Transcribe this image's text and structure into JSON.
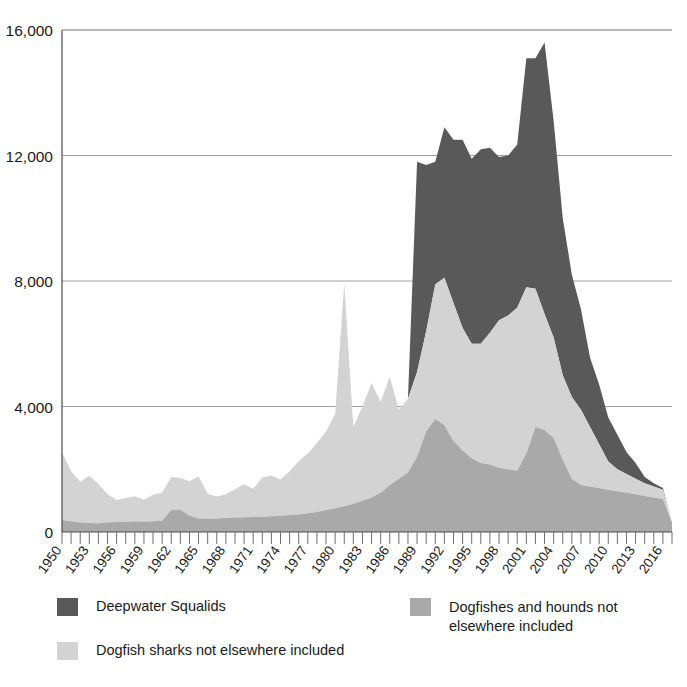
{
  "chart_data": {
    "type": "area",
    "stacked": true,
    "title": "",
    "xlabel": "",
    "ylabel": "",
    "ylim": [
      0,
      16000
    ],
    "xlim": [
      1950,
      2017
    ],
    "grid": true,
    "legend_position": "bottom",
    "ytick_labels": [
      "16,000",
      "12,000",
      "8,000",
      "4,000",
      "0"
    ],
    "ytick_values": [
      16000,
      12000,
      8000,
      4000,
      0
    ],
    "xtick_labels": [
      "1950",
      "1953",
      "1956",
      "1959",
      "1962",
      "1965",
      "1968",
      "1971",
      "1974",
      "1977",
      "1980",
      "1983",
      "1986",
      "1989",
      "1992",
      "1995",
      "1998",
      "2001",
      "2004",
      "2007",
      "2010",
      "2013",
      "2016"
    ],
    "xtick_values": [
      1950,
      1953,
      1956,
      1959,
      1962,
      1965,
      1968,
      1971,
      1974,
      1977,
      1980,
      1983,
      1986,
      1989,
      1992,
      1995,
      1998,
      2001,
      2004,
      2007,
      2010,
      2013,
      2016
    ],
    "x": [
      1950,
      1951,
      1952,
      1953,
      1954,
      1955,
      1956,
      1957,
      1958,
      1959,
      1960,
      1961,
      1962,
      1963,
      1964,
      1965,
      1966,
      1967,
      1968,
      1969,
      1970,
      1971,
      1972,
      1973,
      1974,
      1975,
      1976,
      1977,
      1978,
      1979,
      1980,
      1981,
      1982,
      1983,
      1984,
      1985,
      1986,
      1987,
      1988,
      1989,
      1990,
      1991,
      1992,
      1993,
      1994,
      1995,
      1996,
      1997,
      1998,
      1999,
      2000,
      2001,
      2002,
      2003,
      2004,
      2005,
      2006,
      2007,
      2008,
      2009,
      2010,
      2011,
      2012,
      2013,
      2014,
      2015,
      2016,
      2017
    ],
    "series": [
      {
        "name": "Dogfishes and hounds not elsewhere included",
        "color": "#a9a9a9",
        "stack_order": 1,
        "values": [
          380,
          340,
          300,
          290,
          280,
          300,
          320,
          330,
          340,
          330,
          340,
          360,
          700,
          720,
          520,
          430,
          420,
          430,
          450,
          460,
          470,
          480,
          490,
          500,
          520,
          540,
          560,
          600,
          640,
          700,
          760,
          820,
          900,
          1000,
          1100,
          1250,
          1500,
          1700,
          1900,
          2400,
          3200,
          3600,
          3400,
          2900,
          2600,
          2350,
          2200,
          2150,
          2050,
          2000,
          1950,
          2500,
          3350,
          3250,
          3000,
          2300,
          1700,
          1500,
          1450,
          1400,
          1350,
          1300,
          1250,
          1200,
          1150,
          1100,
          1050,
          300
        ]
      },
      {
        "name": "Dogfish sharks not elsewhere included",
        "color": "#d3d3d3",
        "stack_order": 2,
        "values": [
          2150,
          1600,
          1300,
          1500,
          1250,
          900,
          700,
          750,
          800,
          700,
          850,
          900,
          1050,
          1000,
          1100,
          1350,
          800,
          700,
          750,
          900,
          1050,
          900,
          1250,
          1300,
          1150,
          1400,
          1700,
          1900,
          2200,
          2500,
          3000,
          7100,
          2450,
          3000,
          3650,
          2900,
          3450,
          2200,
          2350,
          2700,
          3200,
          4300,
          4700,
          4400,
          3900,
          3650,
          3800,
          4200,
          4700,
          4900,
          5200,
          5300,
          4400,
          3700,
          3200,
          2700,
          2600,
          2400,
          1900,
          1400,
          900,
          700,
          600,
          500,
          400,
          350,
          300,
          0
        ]
      },
      {
        "name": "Deepwater Squalids",
        "color": "#595959",
        "stack_order": 3,
        "values": [
          0,
          0,
          0,
          0,
          0,
          0,
          0,
          0,
          0,
          0,
          0,
          0,
          0,
          0,
          0,
          0,
          0,
          0,
          0,
          0,
          0,
          0,
          0,
          0,
          0,
          0,
          0,
          0,
          0,
          0,
          0,
          0,
          0,
          0,
          0,
          0,
          0,
          0,
          0,
          6700,
          5300,
          3900,
          4800,
          5200,
          6000,
          5900,
          6200,
          5900,
          5200,
          5100,
          5200,
          7300,
          7350,
          8650,
          6900,
          5000,
          3900,
          3200,
          2200,
          1900,
          1400,
          1100,
          700,
          500,
          200,
          100,
          50,
          0
        ]
      }
    ]
  },
  "legend": {
    "items": [
      {
        "label": "Deepwater Squalids",
        "color": "#595959"
      },
      {
        "label": "Dogfishes and hounds not\nelsewhere included",
        "color": "#a9a9a9"
      },
      {
        "label": "Dogfish sharks not elsewhere included",
        "color": "#d3d3d3"
      }
    ],
    "item1_label": "Deepwater Squalids",
    "item2_line1": "Dogfishes and hounds not",
    "item2_line2": "elsewhere included",
    "item3_label": "Dogfish sharks not elsewhere included"
  },
  "colors": {
    "dark": "#595959",
    "medium": "#a9a9a9",
    "light": "#d3d3d3",
    "grid": "#a0a0a0",
    "axis": "#4a4a4a",
    "text": "#1a1a1a",
    "background": "#ffffff"
  }
}
